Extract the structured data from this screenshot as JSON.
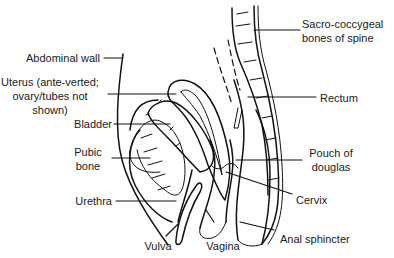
{
  "diagram": {
    "labels": {
      "abdominal_wall": "Abdominal wall",
      "uterus_line1": "Uterus (ante-verted;",
      "uterus_line2": "ovary/tubes not",
      "uterus_line3": "shown)",
      "bladder": "Bladder",
      "pubic_line1": "Pubic",
      "pubic_line2": "bone",
      "urethra": "Urethra",
      "vulva": "Vulva",
      "vagina": "Vagina",
      "sacro_line1": "Sacro-coccygeal",
      "sacro_line2": "bones of spine",
      "rectum": "Rectum",
      "pouch_line1": "Pouch of",
      "pouch_line2": "douglas",
      "cervix": "Cervix",
      "anal_sphincter": "Anal sphincter"
    },
    "colors": {
      "line": "#111111",
      "text": "#1a1a1a",
      "background": "#ffffff"
    }
  }
}
